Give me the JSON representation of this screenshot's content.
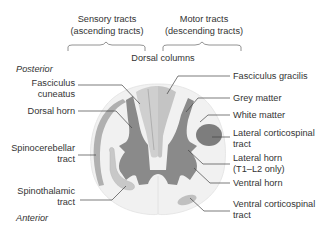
{
  "header": {
    "sensory": {
      "line1": "Sensory tracts",
      "line2": "(ascending tracts)"
    },
    "motor": {
      "line1": "Motor tracts",
      "line2": "(descending tracts)"
    },
    "dorsal_columns": "Dorsal columns"
  },
  "orientation": {
    "posterior": "Posterior",
    "anterior": "Anterior"
  },
  "left_labels": {
    "fasciculus_cuneatus": {
      "line1": "Fasciculus",
      "line2": "cuneatus"
    },
    "dorsal_horn": "Dorsal horn",
    "spinocerebellar": {
      "line1": "Spinocerebellar",
      "line2": "tract"
    },
    "spinothalamic": {
      "line1": "Spinothalamic",
      "line2": "tract"
    }
  },
  "right_labels": {
    "fasciculus_gracilis": "Fasciculus gracilis",
    "grey_matter": "Grey matter",
    "white_matter": "White matter",
    "lateral_corticospinal": {
      "line1": "Lateral corticospinal",
      "line2": "tract"
    },
    "lateral_horn": {
      "line1": "Lateral horn",
      "line2": "(T1–L2 only)"
    },
    "ventral_horn": "Ventral horn",
    "ventral_corticospinal": {
      "line1": "Ventral corticospinal",
      "line2": "tract"
    }
  },
  "colors": {
    "white_matter": "#f1f1f1",
    "grey_matter": "#8a8a8a",
    "light_tract": "#c8c8c8",
    "dark_tract": "#7d7d7d",
    "text": "#333333"
  }
}
